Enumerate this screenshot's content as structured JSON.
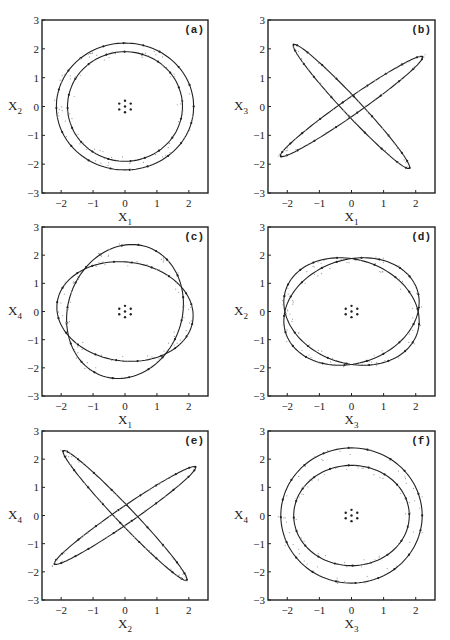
{
  "figure": {
    "panels": [
      {
        "id": "a",
        "tag": "(a)",
        "xlabel": "X",
        "xsub": "1",
        "ylabel": "X",
        "ysub": "2"
      },
      {
        "id": "b",
        "tag": "(b)",
        "xlabel": "X",
        "xsub": "1",
        "ylabel": "X",
        "ysub": "3"
      },
      {
        "id": "c",
        "tag": "(c)",
        "xlabel": "X",
        "xsub": "1",
        "ylabel": "X",
        "ysub": "4"
      },
      {
        "id": "d",
        "tag": "(d)",
        "xlabel": "X",
        "xsub": "3",
        "ylabel": "X",
        "ysub": "2"
      },
      {
        "id": "e",
        "tag": "(e)",
        "xlabel": "X",
        "xsub": "2",
        "ylabel": "X",
        "ysub": "4"
      },
      {
        "id": "f",
        "tag": "(f)",
        "xlabel": "X",
        "xsub": "3",
        "ylabel": "X",
        "ysub": "4"
      }
    ],
    "xticks": [
      "−2",
      "−1",
      "0",
      "1",
      "2"
    ],
    "yticks": [
      "3",
      "2",
      "1",
      "0",
      "−1",
      "−2",
      "−3"
    ]
  },
  "chart_data": [
    {
      "type": "scatter",
      "title": "(a)",
      "xlabel": "X1",
      "ylabel": "X2",
      "xlim": [
        -2.6,
        2.6
      ],
      "ylim": [
        -3,
        3
      ],
      "grid": false,
      "xticks": [
        -2,
        -1,
        0,
        1,
        2
      ],
      "yticks": [
        -3,
        -2,
        -1,
        0,
        1,
        2,
        3
      ],
      "series": [
        {
          "name": "outer closed curve",
          "shape": "ellipse",
          "cx": 0.0,
          "cy": 0.0,
          "rx": 2.15,
          "ry": 2.2,
          "rotation_deg": 0
        },
        {
          "name": "inner closed curve",
          "shape": "ellipse",
          "cx": 0.0,
          "cy": 0.0,
          "rx": 1.8,
          "ry": 1.9,
          "rotation_deg": 0
        },
        {
          "name": "fixed points",
          "shape": "points",
          "points": [
            [
              0,
              0.2
            ],
            [
              0,
              -0.2
            ],
            [
              -0.18,
              0.1
            ],
            [
              0.18,
              0.1
            ],
            [
              -0.18,
              -0.1
            ],
            [
              0.18,
              -0.1
            ],
            [
              0,
              0
            ]
          ]
        }
      ]
    },
    {
      "type": "scatter",
      "title": "(b)",
      "xlabel": "X1",
      "ylabel": "X3",
      "xlim": [
        -2.6,
        2.6
      ],
      "ylim": [
        -3,
        3
      ],
      "grid": false,
      "xticks": [
        -2,
        -1,
        0,
        1,
        2
      ],
      "yticks": [
        -3,
        -2,
        -1,
        0,
        1,
        2,
        3
      ],
      "series": [
        {
          "name": "narrow ellipse (positive slope)",
          "shape": "ellipse",
          "cx": 0.0,
          "cy": 0.0,
          "rx": 2.8,
          "ry": 0.28,
          "rotation_deg": 38,
          "endpoints": [
            [
              -2.15,
              -1.75
            ],
            [
              2.15,
              1.65
            ]
          ]
        },
        {
          "name": "narrow ellipse (negative slope)",
          "shape": "ellipse",
          "cx": 0.0,
          "cy": 0.0,
          "rx": 2.8,
          "ry": 0.28,
          "rotation_deg": -50,
          "endpoints": [
            [
              -1.75,
              2.1
            ],
            [
              1.75,
              -2.15
            ]
          ]
        }
      ]
    },
    {
      "type": "scatter",
      "title": "(c)",
      "xlabel": "X1",
      "ylabel": "X4",
      "xlim": [
        -2.6,
        2.6
      ],
      "ylim": [
        -3,
        3
      ],
      "grid": false,
      "xticks": [
        -2,
        -1,
        0,
        1,
        2
      ],
      "yticks": [
        -3,
        -2,
        -1,
        0,
        1,
        2,
        3
      ],
      "series": [
        {
          "name": "horizontal closed curve",
          "shape": "ellipse",
          "cx": 0.0,
          "cy": 0.0,
          "rx": 2.15,
          "ry": 1.75,
          "rotation_deg": -12
        },
        {
          "name": "vertical closed curve",
          "shape": "ellipse",
          "cx": 0.0,
          "cy": 0.0,
          "rx": 1.8,
          "ry": 2.4,
          "rotation_deg": -12
        },
        {
          "name": "fixed points",
          "shape": "points",
          "points": [
            [
              0,
              0.2
            ],
            [
              0,
              -0.2
            ],
            [
              -0.18,
              0.1
            ],
            [
              0.18,
              0.1
            ],
            [
              -0.18,
              -0.1
            ],
            [
              0.18,
              -0.1
            ],
            [
              0,
              0
            ]
          ]
        }
      ]
    },
    {
      "type": "scatter",
      "title": "(d)",
      "xlabel": "X3",
      "ylabel": "X2",
      "xlim": [
        -2.6,
        2.6
      ],
      "ylim": [
        -3,
        3
      ],
      "grid": false,
      "xticks": [
        -2,
        -1,
        0,
        1,
        2
      ],
      "yticks": [
        -3,
        -2,
        -1,
        0,
        1,
        2,
        3
      ],
      "series": [
        {
          "name": "tilted closed curve 1",
          "shape": "ellipse",
          "cx": 0.0,
          "cy": 0.0,
          "rx": 2.2,
          "ry": 1.8,
          "rotation_deg": -30
        },
        {
          "name": "tilted closed curve 2",
          "shape": "ellipse",
          "cx": 0.0,
          "cy": 0.0,
          "rx": 2.2,
          "ry": 1.8,
          "rotation_deg": 30
        },
        {
          "name": "fixed points",
          "shape": "points",
          "points": [
            [
              0,
              0.2
            ],
            [
              0,
              -0.2
            ],
            [
              -0.18,
              0.1
            ],
            [
              0.18,
              0.1
            ],
            [
              -0.18,
              -0.1
            ],
            [
              0.18,
              -0.1
            ],
            [
              0,
              0
            ]
          ]
        }
      ]
    },
    {
      "type": "scatter",
      "title": "(e)",
      "xlabel": "X2",
      "ylabel": "X4",
      "xlim": [
        -2.6,
        2.6
      ],
      "ylim": [
        -3,
        3
      ],
      "grid": false,
      "xticks": [
        -2,
        -1,
        0,
        1,
        2
      ],
      "yticks": [
        -3,
        -2,
        -1,
        0,
        1,
        2,
        3
      ],
      "series": [
        {
          "name": "narrow ellipse (positive slope)",
          "shape": "ellipse",
          "cx": 0.0,
          "cy": 0.0,
          "rx": 2.8,
          "ry": 0.28,
          "rotation_deg": 38,
          "endpoints": [
            [
              -2.15,
              -1.75
            ],
            [
              2.15,
              1.75
            ]
          ]
        },
        {
          "name": "narrow ellipse (negative slope)",
          "shape": "ellipse",
          "cx": 0.0,
          "cy": 0.0,
          "rx": 3.0,
          "ry": 0.28,
          "rotation_deg": -50,
          "endpoints": [
            [
              -1.95,
              2.35
            ],
            [
              1.95,
              -2.35
            ]
          ]
        }
      ]
    },
    {
      "type": "scatter",
      "title": "(f)",
      "xlabel": "X3",
      "ylabel": "X4",
      "xlim": [
        -2.6,
        2.6
      ],
      "ylim": [
        -3,
        3
      ],
      "grid": false,
      "xticks": [
        -2,
        -1,
        0,
        1,
        2
      ],
      "yticks": [
        -3,
        -2,
        -1,
        0,
        1,
        2,
        3
      ],
      "series": [
        {
          "name": "outer closed curve",
          "shape": "ellipse",
          "cx": 0.0,
          "cy": 0.0,
          "rx": 2.2,
          "ry": 2.4,
          "rotation_deg": 0
        },
        {
          "name": "inner closed curve",
          "shape": "ellipse",
          "cx": 0.0,
          "cy": 0.0,
          "rx": 1.8,
          "ry": 1.78,
          "rotation_deg": 0
        },
        {
          "name": "fixed points",
          "shape": "points",
          "points": [
            [
              0,
              0.2
            ],
            [
              0,
              -0.2
            ],
            [
              -0.18,
              0.1
            ],
            [
              0.18,
              0.1
            ],
            [
              -0.18,
              -0.1
            ],
            [
              0.18,
              -0.1
            ],
            [
              0,
              0
            ]
          ]
        }
      ]
    }
  ]
}
